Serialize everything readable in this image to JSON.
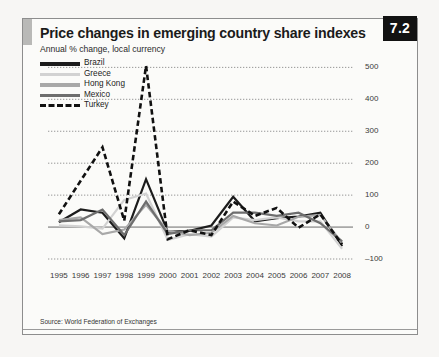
{
  "figure": {
    "badge": "7.2",
    "title": "Price changes in emerging country share indexes",
    "subtitle": "Annual % change, local currency",
    "source": "Source: World Federation of Exchanges"
  },
  "legend": {
    "position": "top-left",
    "items": [
      {
        "label": "Brazil",
        "color": "#1c1c1c",
        "style": "solid",
        "width": 3.6
      },
      {
        "label": "Greece",
        "color": "#d2d2d2",
        "style": "solid",
        "width": 3.4
      },
      {
        "label": "Hong Kong",
        "color": "#a8a8a8",
        "style": "solid",
        "width": 3.4
      },
      {
        "label": "Mexico",
        "color": "#6e6e6e",
        "style": "solid",
        "width": 3.4
      },
      {
        "label": "Turkey",
        "color": "#111111",
        "style": "dashed",
        "width": 3.4
      }
    ]
  },
  "chart_data": {
    "type": "line",
    "title": "Price changes in emerging country share indexes",
    "subtitle": "Annual % change, local currency",
    "xlabel": "",
    "ylabel": "Annual % change, local currency",
    "ylim": [
      -100,
      520
    ],
    "yticks": [
      -100,
      0,
      100,
      200,
      300,
      400,
      500
    ],
    "ytick_labels": [
      "–100",
      "0",
      "100",
      "200",
      "300",
      "400",
      "500"
    ],
    "y_axis_position": "right",
    "grid": "horizontal-dotted",
    "x": [
      1995,
      1996,
      1997,
      1998,
      1999,
      2000,
      2001,
      2002,
      2003,
      2004,
      2005,
      2006,
      2007,
      2008
    ],
    "categories": [
      "1995",
      "1996",
      "1997",
      "1998",
      "1999",
      "2000",
      "2001",
      "2002",
      "2003",
      "2004",
      "2005",
      "2006",
      "2007",
      "2008"
    ],
    "series": [
      {
        "name": "Brazil",
        "color": "#1c1c1c",
        "style": "solid",
        "values": [
          15,
          55,
          45,
          -35,
          150,
          -15,
          -12,
          5,
          95,
          18,
          28,
          33,
          45,
          -60
        ]
      },
      {
        "name": "Greece",
        "color": "#d2d2d2",
        "style": "solid",
        "values": [
          5,
          2,
          -5,
          85,
          105,
          -40,
          -22,
          -30,
          30,
          22,
          30,
          18,
          18,
          -68
        ]
      },
      {
        "name": "Hong Kong",
        "color": "#a8a8a8",
        "style": "solid",
        "values": [
          22,
          30,
          -22,
          -8,
          70,
          -12,
          -25,
          -18,
          35,
          12,
          5,
          32,
          38,
          -50
        ]
      },
      {
        "name": "Mexico",
        "color": "#6e6e6e",
        "style": "solid",
        "values": [
          18,
          22,
          55,
          -25,
          80,
          -22,
          -10,
          -10,
          45,
          45,
          35,
          45,
          12,
          -45
        ]
      },
      {
        "name": "Turkey",
        "color": "#111111",
        "style": "dashed",
        "values": [
          40,
          145,
          250,
          20,
          505,
          -38,
          -10,
          -25,
          80,
          35,
          60,
          -2,
          40,
          -55
        ]
      }
    ]
  }
}
